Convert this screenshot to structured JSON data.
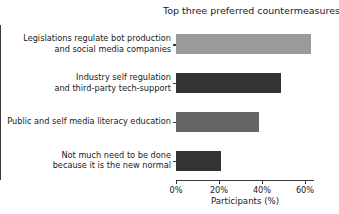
{
  "chart_data": {
    "type": "bar",
    "orientation": "horizontal",
    "title": "Top three preferred countermeasures",
    "xlabel": "Participants (%)",
    "ylabel": "",
    "xlim": [
      0,
      65
    ],
    "grid": false,
    "legend": null,
    "categories": [
      "Legislations regulate bot production\nand social media companies",
      "Industry self regulation\nand third-party tech-support",
      "Public and self media literacy education",
      "Not much need to be done\nbecause it is the new normal"
    ],
    "values": [
      63,
      49,
      38.5,
      21
    ],
    "bar_colors": [
      "#9a9a9a",
      "#333333",
      "#666666",
      "#333333"
    ],
    "xticks": [
      0,
      20,
      40,
      60
    ],
    "xtick_labels": [
      "0%",
      "20%",
      "40%",
      "60%"
    ]
  },
  "axis": {
    "line_color": "#3a3a3a"
  }
}
